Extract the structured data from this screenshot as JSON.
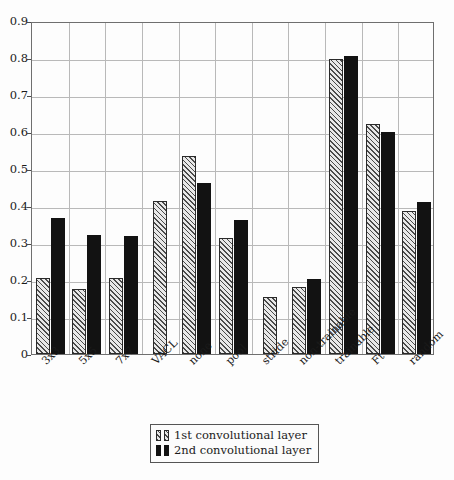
{
  "chart_data": {
    "type": "bar",
    "title": "",
    "xlabel": "",
    "ylabel": "",
    "ylim": [
      0,
      0.9
    ],
    "grid": true,
    "legend_position": "below-axes",
    "categories": [
      "3x3",
      "5x5",
      "7x7",
      "VACL",
      "none",
      "pool",
      "stride",
      "non-trainable",
      "trainable",
      "Ft",
      "random"
    ],
    "ytick_labels": [
      "0",
      "0.1",
      "0.2",
      "0.3",
      "0.4",
      "0.5",
      "0.6",
      "0.7",
      "0.8",
      "0.9"
    ],
    "ytick_values": [
      0,
      0.1,
      0.2,
      0.3,
      0.4,
      0.5,
      0.6,
      0.7,
      0.8,
      0.9
    ],
    "series": [
      {
        "name": "1st convolutional layer",
        "style": "hatched",
        "values": [
          0.205,
          0.177,
          0.206,
          0.413,
          0.536,
          0.313,
          0.155,
          0.182,
          0.797,
          0.622,
          0.386
        ]
      },
      {
        "name": "2nd convolutional layer",
        "style": "solid-black",
        "values": [
          0.367,
          0.322,
          0.318,
          null,
          0.463,
          0.362,
          null,
          0.202,
          0.806,
          0.6,
          0.412
        ]
      }
    ]
  },
  "legend": {
    "entries": [
      {
        "label": "1st convolutional layer"
      },
      {
        "label": "2nd convolutional layer"
      }
    ]
  },
  "colors": {
    "series1_fill": "#e8e8e8",
    "series1_hatch": "#4a4a4a",
    "series2_fill": "#121212",
    "grid": "#b9b9b9",
    "axis": "#6f6f6f",
    "background": "#fdfdfd"
  }
}
